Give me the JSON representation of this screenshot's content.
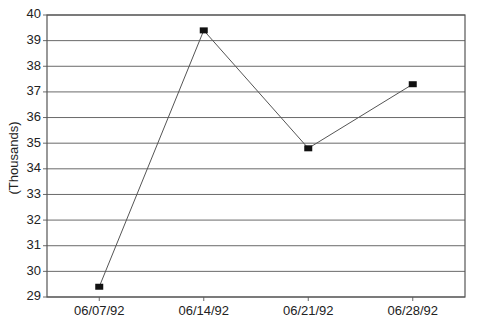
{
  "chart_data": {
    "type": "line",
    "title": "",
    "xlabel": "",
    "ylabel": "(Thousands)",
    "categories": [
      "06/07/92",
      "06/14/92",
      "06/21/92",
      "06/28/92"
    ],
    "series": [
      {
        "name": "",
        "values": [
          29.4,
          39.4,
          34.8,
          37.3
        ]
      }
    ],
    "ylim": [
      29,
      40
    ],
    "yticks": [
      29,
      30,
      31,
      32,
      33,
      34,
      35,
      36,
      37,
      38,
      39,
      40
    ],
    "grid": true,
    "legend": "none",
    "marker": "square"
  },
  "colors": {
    "grid": "#6a6a6a",
    "line": "#555555",
    "marker": "#111111",
    "text": "#222222"
  }
}
